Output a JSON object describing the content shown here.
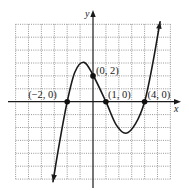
{
  "chart_data": {
    "type": "line",
    "title": "",
    "xlabel": "x",
    "ylabel": "y",
    "xlim": [
      -6,
      6
    ],
    "ylim": [
      -6,
      6
    ],
    "grid": true,
    "grid_step": 1,
    "legend": null,
    "series": [
      {
        "name": "f(x)",
        "description": "cubic through (-2,0), (0,2), (1,0), (4,0) with arrows at both ends",
        "points": [
          {
            "x": -3.1,
            "y": -6.2
          },
          {
            "x": -2.6,
            "y": -3.2
          },
          {
            "x": -2.0,
            "y": 0.0
          },
          {
            "x": -1.4,
            "y": 2.3
          },
          {
            "x": -0.7,
            "y": 3.05
          },
          {
            "x": 0.0,
            "y": 2.07
          },
          {
            "x": 1.0,
            "y": 0.0
          },
          {
            "x": 1.8,
            "y": -1.8
          },
          {
            "x": 2.56,
            "y": -2.45
          },
          {
            "x": 3.3,
            "y": -1.7
          },
          {
            "x": 4.0,
            "y": 0.0
          },
          {
            "x": 4.6,
            "y": 2.8
          },
          {
            "x": 5.2,
            "y": 6.2
          }
        ]
      }
    ],
    "annotations": [
      {
        "text": "(−2, 0)",
        "x": -2,
        "y": 0,
        "label_dx": -39,
        "label_dy": -4
      },
      {
        "text": "(0, 2)",
        "x": 0,
        "y": 2,
        "label_dx": 3,
        "label_dy": -2
      },
      {
        "text": "(1, 0)",
        "x": 1,
        "y": 0,
        "label_dx": 2,
        "label_dy": -4
      },
      {
        "text": "(4, 0)",
        "x": 4,
        "y": 0,
        "label_dx": 3,
        "label_dy": -4
      }
    ]
  },
  "labels": {
    "x_axis": "x",
    "y_axis": "y"
  }
}
